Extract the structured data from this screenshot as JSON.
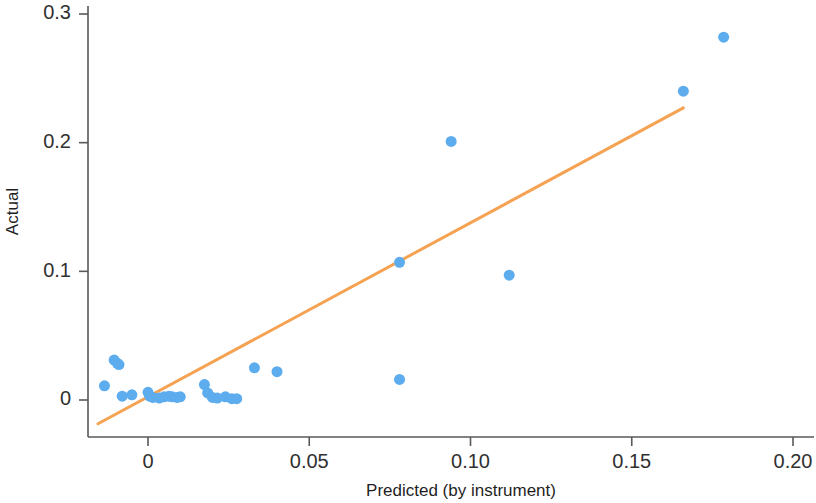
{
  "chart_data": {
    "type": "scatter",
    "title": "",
    "subtitle": "",
    "xlabel": "Predicted (by instrument)",
    "ylabel": "Actual",
    "xlim": [
      -0.019,
      0.208
    ],
    "ylim": [
      -0.026,
      0.312
    ],
    "grid": false,
    "legend": null,
    "xticks": [
      0,
      0.05,
      0.1,
      0.15,
      0.2
    ],
    "xticklabels": [
      "0",
      "0.05",
      "0.10",
      "0.15",
      "0.20"
    ],
    "yticks": [
      0,
      0.1,
      0.2,
      0.3
    ],
    "yticklabels": [
      "0",
      "0.1",
      "0.2",
      "0.3"
    ],
    "point_color": "#5CACEE",
    "point_size": 11,
    "line_color": "#F5A252",
    "line_width": 3,
    "series": [
      {
        "name": "observations",
        "marker": "circle",
        "x": [
          -0.0135,
          -0.0105,
          -0.0095,
          -0.009,
          -0.008,
          -0.005,
          0.0,
          0.0005,
          0.0015,
          0.0035,
          0.005,
          0.0065,
          0.0075,
          0.009,
          0.01,
          0.0175,
          0.0185,
          0.02,
          0.0215,
          0.024,
          0.026,
          0.0275,
          0.033,
          0.04,
          0.078,
          0.078,
          0.094,
          0.112,
          0.166,
          0.1785
        ],
        "y": [
          0.011,
          0.031,
          0.0285,
          0.0275,
          0.003,
          0.004,
          0.006,
          0.003,
          0.002,
          0.0015,
          0.0025,
          0.003,
          0.0025,
          0.002,
          0.0025,
          0.012,
          0.0055,
          0.002,
          0.0015,
          0.0025,
          0.001,
          0.001,
          0.025,
          0.022,
          0.016,
          0.107,
          0.201,
          0.097,
          0.24,
          0.282
        ]
      }
    ],
    "trend_line": {
      "name": "fit-line",
      "x_start": -0.0155,
      "y_start": -0.0185,
      "x_end": 0.166,
      "y_end": 0.227
    }
  }
}
